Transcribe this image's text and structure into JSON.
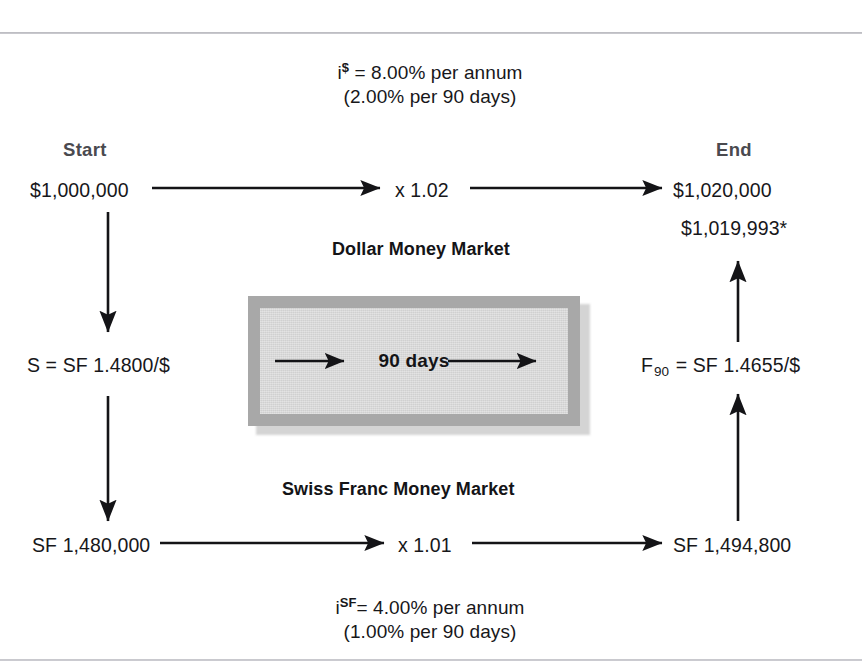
{
  "figure": {
    "title_hidden": "",
    "top_rate": {
      "line1_prefix": "i",
      "line1_superscript": "$",
      "line1_rest": " = 8.00% per annum",
      "line2": "(2.00% per 90 days)"
    },
    "bottom_rate": {
      "line1_prefix": "i",
      "line1_superscript": "SF",
      "line1_rest": "= 4.00% per annum",
      "line2": "(1.00% per 90 days)"
    },
    "column_labels": {
      "start": "Start",
      "end": "End"
    },
    "dollar_market": {
      "label": "Dollar Money Market",
      "start_value": "$1,000,000",
      "factor": "x  1.02",
      "end_value": "$1,020,000",
      "end_value_alt": "$1,019,993*"
    },
    "swiss_market": {
      "label": "Swiss Franc Money Market",
      "start_value": "SF 1,480,000",
      "factor": "x  1.01",
      "end_value": "SF 1,494,800"
    },
    "spot_rate": {
      "prefix": "S = SF 1.4800/$"
    },
    "forward_rate": {
      "symbol": "F",
      "subscript": "90",
      "rest": " = SF 1.4655/$"
    },
    "center_box": {
      "label": "90 days"
    },
    "colors": {
      "text": "#17171a",
      "endpoint_label": "#4a4a4f",
      "box_inner": "#d8d8d8",
      "box_frame": "#a8a8a8",
      "box_shadow": "#c4c4c4",
      "rule": "#bcbcc2"
    }
  }
}
